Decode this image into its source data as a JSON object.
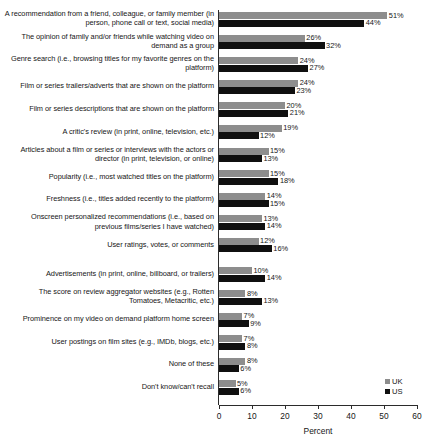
{
  "chart_data": {
    "type": "bar",
    "orientation": "horizontal",
    "title": "",
    "xlabel": "Percent",
    "ylabel": "",
    "xlim": [
      0,
      60
    ],
    "xticks": [
      0,
      10,
      20,
      30,
      40,
      50,
      60
    ],
    "grid": false,
    "legend_position": "bottom-right",
    "categories": [
      "A recommendation from a friend, colleague, or family member (in person, phone call or text, social media)",
      "The opinion of family and/or friends while watching video on demand as a group",
      "Genre search (i.e., browsing titles for my favorite genres on the platform)",
      "Film or series trailers/adverts that are shown on the platform",
      "Film or series descriptions that are shown on the platform",
      "A critic's review (in print, online, television, etc.)",
      "Articles about a film or series or interviews with the actors or director (in print, television, or online)",
      "Popularity (i.e., most watched titles on the platform)",
      "Freshness (i.e., titles added recently to the platform)",
      "Onscreen personalized recommendations (i.e., based on previous films/series I have watched)",
      "User ratings, votes, or comments",
      "Advertisements (in print, online, billboard, or trailers)",
      "The score on review aggregator websites (e.g., Rotten Tomatoes, Metacritic, etc.)",
      "Prominence on my video on demand platform home screen",
      "User postings on film sites (e.g., IMDb, blogs, etc.)",
      "None of these",
      "Don't know/can't recall"
    ],
    "series": [
      {
        "name": "UK",
        "color": "#8d8d8d",
        "values": [
          51,
          26,
          24,
          24,
          20,
          19,
          15,
          15,
          14,
          13,
          12,
          10,
          8,
          7,
          7,
          8,
          5
        ],
        "labels": [
          "51%",
          "26%",
          "24%",
          "24%",
          "20%",
          "19%",
          "15%",
          "15%",
          "14%",
          "13%",
          "12%",
          "10%",
          "8%",
          "7%",
          "7%",
          "8%",
          "5%"
        ]
      },
      {
        "name": "US",
        "color": "#101010",
        "values": [
          44,
          32,
          27,
          23,
          21,
          12,
          13,
          18,
          15,
          14,
          16,
          14,
          13,
          9,
          8,
          6,
          6
        ],
        "labels": [
          "44%",
          "32%",
          "27%",
          "23%",
          "21%",
          "12%",
          "13%",
          "18%",
          "15%",
          "14%",
          "16%",
          "14%",
          "13%",
          "9%",
          "8%",
          "6%",
          "6%"
        ]
      }
    ]
  },
  "legend": {
    "items": [
      {
        "label": "UK",
        "color": "#8d8d8d"
      },
      {
        "label": "US",
        "color": "#101010"
      }
    ]
  },
  "axis": {
    "x_title": "Percent",
    "tick_labels": [
      "0",
      "10",
      "20",
      "30",
      "40",
      "50",
      "60"
    ]
  }
}
